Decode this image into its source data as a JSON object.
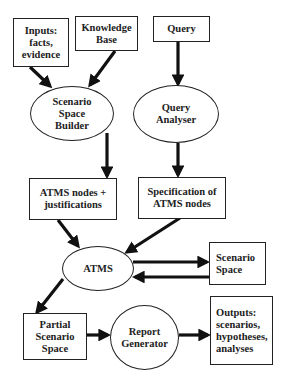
{
  "diagram": {
    "type": "flowchart",
    "nodes": {
      "inputs": {
        "label": "Inputs:\nfacts,\nevidence",
        "shape": "rectangle"
      },
      "knowledge_base": {
        "label": "Knowledge\nBase",
        "shape": "rectangle"
      },
      "query": {
        "label": "Query",
        "shape": "rectangle"
      },
      "scenario_space_builder": {
        "label": "Scenario\nSpace\nBuilder",
        "shape": "ellipse"
      },
      "query_analyser": {
        "label": "Query\nAnalyser",
        "shape": "ellipse"
      },
      "atms_nodes": {
        "label": "ATMS nodes +\njustifications",
        "shape": "rectangle"
      },
      "specification": {
        "label": "Specification of\nATMS nodes",
        "shape": "rectangle"
      },
      "atms": {
        "label": "ATMS",
        "shape": "ellipse"
      },
      "scenario_space": {
        "label": "Scenario\nSpace",
        "shape": "rectangle"
      },
      "partial_scenario_space": {
        "label": "Partial\nScenario\nSpace",
        "shape": "rectangle"
      },
      "report_generator": {
        "label": "Report\nGenerator",
        "shape": "ellipse"
      },
      "outputs": {
        "label": "Outputs:\nscenarios,\nhypotheses,\nanalyses",
        "shape": "rectangle"
      }
    },
    "edges": [
      {
        "from": "inputs",
        "to": "scenario_space_builder"
      },
      {
        "from": "knowledge_base",
        "to": "scenario_space_builder"
      },
      {
        "from": "query",
        "to": "query_analyser"
      },
      {
        "from": "scenario_space_builder",
        "to": "atms_nodes"
      },
      {
        "from": "query_analyser",
        "to": "specification"
      },
      {
        "from": "atms_nodes",
        "to": "atms"
      },
      {
        "from": "specification",
        "to": "atms"
      },
      {
        "from": "atms",
        "to": "scenario_space"
      },
      {
        "from": "scenario_space",
        "to": "atms"
      },
      {
        "from": "atms",
        "to": "partial_scenario_space"
      },
      {
        "from": "partial_scenario_space",
        "to": "report_generator"
      },
      {
        "from": "report_generator",
        "to": "outputs"
      }
    ],
    "colors": {
      "stroke": "#222222",
      "fill": "#ffffff"
    }
  }
}
